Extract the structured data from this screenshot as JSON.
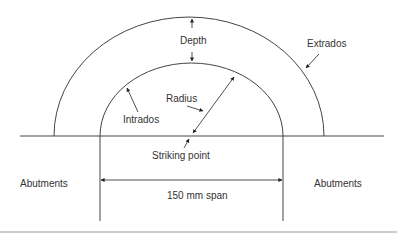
{
  "diagram": {
    "type": "semicircular arch anatomy",
    "labels": {
      "depth": "Depth",
      "extrados": "Extrados",
      "intrados": "Intrados",
      "radius": "Radius",
      "striking_point": "Striking point",
      "abutments_left": "Abutments",
      "abutments_right": "Abutments",
      "span": "150 mm span"
    },
    "colors": {
      "line": "#444444",
      "text": "#333333",
      "background": "#ffffff"
    }
  }
}
